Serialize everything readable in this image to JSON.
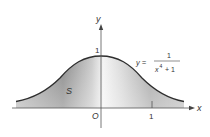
{
  "figure": {
    "function_label": {
      "lhs": "y =",
      "numerator": "1",
      "denominator_base": "x",
      "denominator_exp": "4",
      "denominator_rest": "+ 1"
    },
    "region_label": "S",
    "axis_labels": {
      "x": "x",
      "y": "y"
    },
    "origin_label": "O",
    "tick_labels": {
      "x_one": "1",
      "y_one": "1"
    },
    "colors": {
      "curve": "#2e2e2e",
      "axis": "#555555",
      "shade_dark": "#8a8a8a",
      "shade_light": "#f2f2f2"
    }
  }
}
